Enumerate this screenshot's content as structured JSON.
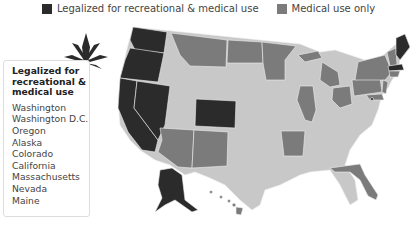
{
  "legend": {
    "items": [
      {
        "label": "Legalized for recreational & medical use",
        "color": "#2b2b2b"
      },
      {
        "label": "Medical use only",
        "color": "#7b7b7b"
      }
    ]
  },
  "colors": {
    "recreational": "#2b2b2b",
    "medical": "#7b7b7b",
    "none": "#c8c8c8",
    "border": "#eeeeee"
  },
  "info_box": {
    "title": "Legalized for recreational & medical use",
    "states": [
      "Washington",
      "Washington D.C.",
      "Oregon",
      "Alaska",
      "Colorado",
      "California",
      "Massachusetts",
      "Nevada",
      "Maine"
    ]
  },
  "map": {
    "recreational_states": [
      "Washington",
      "Oregon",
      "California",
      "Nevada",
      "Colorado",
      "Alaska",
      "Massachusetts",
      "Maine",
      "Washington D.C."
    ],
    "medical_states": [
      "Montana",
      "North Dakota",
      "Minnesota",
      "Michigan",
      "Illinois",
      "Ohio",
      "Pennsylvania",
      "New York",
      "New Hampshire",
      "Vermont",
      "Connecticut",
      "Rhode Island",
      "New Jersey",
      "Delaware",
      "Maryland",
      "Arizona",
      "New Mexico",
      "Arkansas",
      "Florida",
      "Hawaii"
    ]
  }
}
